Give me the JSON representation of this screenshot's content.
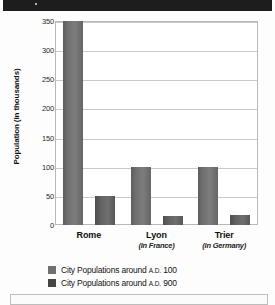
{
  "banner": {
    "label": ""
  },
  "chart_data": {
    "type": "bar",
    "title": "",
    "xlabel": "",
    "ylabel": "Population (in thousands)",
    "ylim": [
      0,
      350
    ],
    "yticks": [
      0,
      50,
      100,
      150,
      200,
      250,
      300,
      350
    ],
    "ytick_labels": [
      "0",
      "50",
      "100",
      "150",
      "200",
      "250",
      "300",
      "350"
    ],
    "grid": true,
    "legend_position": "bottom-left",
    "categories": [
      "Rome",
      "Lyon",
      "Trier"
    ],
    "category_subtitles": [
      "",
      "(in France)",
      "(in Germany)"
    ],
    "series": [
      {
        "name": "City Populations around A.D. 100",
        "name_prefix": "City Populations around",
        "name_era": "A.D.",
        "name_year": "100",
        "color": "#707070",
        "values": [
          350,
          100,
          100
        ]
      },
      {
        "name": "City Populations around A.D. 900",
        "name_prefix": "City Populations around",
        "name_era": "A.D.",
        "name_year": "900",
        "color": "#454545",
        "values": [
          50,
          15,
          18
        ]
      }
    ]
  },
  "colors": {
    "banner": "#1d1d1d",
    "plot_background": "#ffffff",
    "gridline": "#c9c9c9",
    "axis_border": "#b9b9b9",
    "series_100": "#707070",
    "series_900": "#454545",
    "text": "#141414"
  }
}
